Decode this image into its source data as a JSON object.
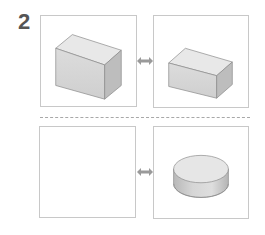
{
  "problem": {
    "number": "2"
  },
  "rows": [
    {
      "left": {
        "shape": "tall-rectangular-block",
        "label": ""
      },
      "connector": "double-arrow-icon",
      "right": {
        "shape": "wide-rectangular-block",
        "label": ""
      }
    },
    {
      "left": {
        "shape": "empty",
        "label": ""
      },
      "connector": "double-arrow-icon",
      "right": {
        "shape": "flat-cylinder-disc",
        "label": ""
      }
    }
  ],
  "colors": {
    "panel_border": "#c8c8c8",
    "divider": "#a8a8a8",
    "number_text": "#555555",
    "shape_top": "#e6e6e6",
    "shape_front": "#d2d2d2",
    "shape_side": "#bdbdbd",
    "shape_edge": "#8a8a8a",
    "arrow": "#9a9a9a"
  }
}
